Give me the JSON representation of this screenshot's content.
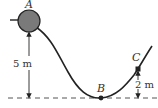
{
  "diagram": {
    "points": [
      {
        "id": "A",
        "label": "A",
        "x": 29,
        "y": 21
      },
      {
        "id": "B",
        "label": "B",
        "x": 101,
        "y": 98
      },
      {
        "id": "C",
        "label": "C",
        "x": 138,
        "y": 69
      }
    ],
    "dimensions": {
      "height_A": "5 m",
      "height_C": "2 m"
    },
    "colors": {
      "ball": "#7a7a7a",
      "stroke": "#222222",
      "dashed": "#555555"
    }
  }
}
